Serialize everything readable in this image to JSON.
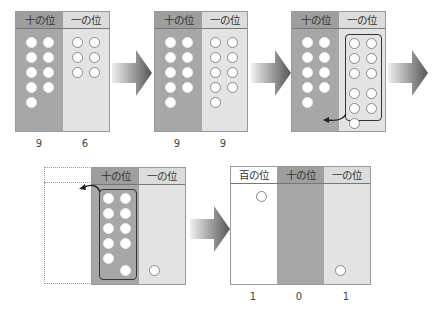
{
  "labels": {
    "tens": "十の位",
    "ones": "一の位",
    "hundreds": "百の位"
  },
  "steps": [
    {
      "tens_count": 9,
      "ones_count": 6,
      "tens_value": "9",
      "ones_value": "6"
    },
    {
      "tens_count": 9,
      "ones_count": 9,
      "tens_value": "9",
      "ones_value": "9"
    },
    {
      "tens_count": 9,
      "ones_count": 11,
      "note": "ten ones grouped and carried to tens"
    },
    {
      "tens_count": 11,
      "ones_count": 1,
      "note": "ten tens grouped and carried to hundreds"
    },
    {
      "hundreds_count": 1,
      "tens_count": 0,
      "ones_count": 1,
      "hundreds_value": "1",
      "tens_value": "0",
      "ones_value": "1"
    }
  ],
  "arrow_icon": "right-arrow-icon",
  "colors": {
    "tens_bg": "#a7a7a7",
    "ones_bg": "#e3e3e3",
    "hundreds_bg": "#ffffff",
    "arrow": "#555555"
  }
}
